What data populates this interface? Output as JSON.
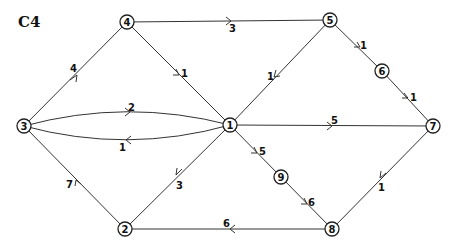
{
  "title": "C4",
  "nodes": [
    {
      "id": "1",
      "x": 230,
      "y": 125
    },
    {
      "id": "2",
      "x": 125,
      "y": 229
    },
    {
      "id": "3",
      "x": 24,
      "y": 126
    },
    {
      "id": "4",
      "x": 127,
      "y": 22
    },
    {
      "id": "5",
      "x": 330,
      "y": 20
    },
    {
      "id": "6",
      "x": 382,
      "y": 71
    },
    {
      "id": "7",
      "x": 433,
      "y": 126
    },
    {
      "id": "8",
      "x": 332,
      "y": 229
    },
    {
      "id": "9",
      "x": 281,
      "y": 177
    }
  ],
  "edges": [
    {
      "from": "3",
      "to": "4",
      "weight": "4"
    },
    {
      "from": "4",
      "to": "5",
      "weight": "3"
    },
    {
      "from": "4",
      "to": "1",
      "weight": "1"
    },
    {
      "from": "5",
      "to": "1",
      "weight": "1"
    },
    {
      "from": "5",
      "to": "6",
      "weight": "1"
    },
    {
      "from": "6",
      "to": "7",
      "weight": "1"
    },
    {
      "from": "3",
      "to": "1",
      "weight": "2"
    },
    {
      "from": "1",
      "to": "3",
      "weight": "1"
    },
    {
      "from": "1",
      "to": "7",
      "weight": "5"
    },
    {
      "from": "1",
      "to": "9",
      "weight": "5"
    },
    {
      "from": "9",
      "to": "8",
      "weight": "6"
    },
    {
      "from": "7",
      "to": "8",
      "weight": "1"
    },
    {
      "from": "1",
      "to": "2",
      "weight": "3"
    },
    {
      "from": "2",
      "to": "3",
      "weight": "7"
    },
    {
      "from": "8",
      "to": "2",
      "weight": "6"
    }
  ]
}
